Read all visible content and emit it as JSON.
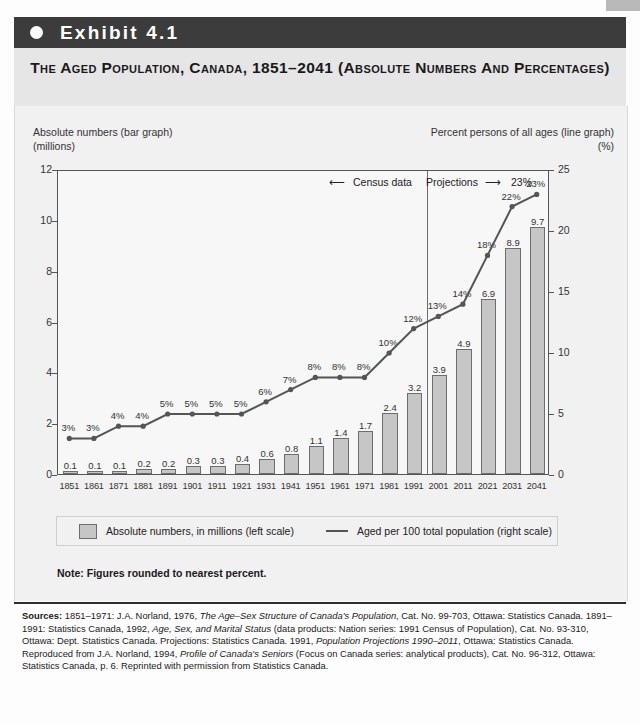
{
  "exhibit": {
    "bullet_icon": "filled-circle-icon",
    "label": "Exhibit 4.1"
  },
  "title": "The Aged Population, Canada, 1851–2041 (Absolute Numbers and Percentages)",
  "axis_captions": {
    "left_line1": "Absolute numbers (bar graph)",
    "left_line2": "(millions)",
    "right_line1": "Percent persons of all ages (line graph)",
    "right_line2": "(%)"
  },
  "annotations": {
    "census_data": "Census data",
    "projections": "Projections",
    "left_arrow_icon": "arrow-left-icon",
    "right_arrow_icon": "arrow-right-icon"
  },
  "legend": {
    "bars_label": "Absolute numbers, in millions (left scale)",
    "line_label": "Aged per 100 total population (right scale)",
    "bar_swatch_color": "#c6c6c6",
    "line_swatch_color": "#555555"
  },
  "note": "Note: Figures rounded to nearest percent.",
  "sources": {
    "label": "Sources:",
    "text_1": " 1851–1971: J.A. Norland, 1976, ",
    "italic_1": "The Age–Sex Structure of Canada's Population",
    "text_2": ", Cat. No. 99-703, Ottawa: Statistics Canada. 1891–1991: Statistics Canada, 1992, ",
    "italic_2": "Age, Sex, and Marital Status",
    "text_3": " (data products: Nation series: 1991 Census of Population), Cat. No. 93-310, Ottawa: Dept. Statistics Canada. Projections: Statistics Canada. 1991, ",
    "italic_3": "Population Projections 1990–2011",
    "text_4": ", Ottawa: Statistics Canada. Reproduced from J.A. Norland, 1994, ",
    "italic_4": "Profile of Canada's Seniors",
    "text_5": " (Focus on Canada series: analytical products), Cat. No. 96-312, Ottawa: Statistics Canada, p. 6. Reprinted with permission from Statistics Canada."
  },
  "chart_data": {
    "type": "bar",
    "title": "The Aged Population, Canada, 1851–2041 (Absolute Numbers and Percentages)",
    "xlabel": "",
    "ylabel": "Absolute numbers (bar graph) (millions)",
    "y2label": "Percent persons of all ages (line graph) (%)",
    "categories": [
      "1851",
      "1861",
      "1871",
      "1881",
      "1891",
      "1901",
      "1911",
      "1921",
      "1931",
      "1941",
      "1951",
      "1961",
      "1971",
      "1981",
      "1991",
      "2001",
      "2011",
      "2021",
      "2031",
      "2041"
    ],
    "ylim": [
      0,
      12
    ],
    "yticks": [
      0,
      2,
      4,
      6,
      8,
      10,
      12
    ],
    "y2lim": [
      0,
      25
    ],
    "y2ticks": [
      0,
      5,
      10,
      15,
      20,
      25
    ],
    "grid": false,
    "legend_position": "bottom",
    "series": [
      {
        "name": "Absolute numbers, in millions (left scale)",
        "type": "bar",
        "axis": "left",
        "color": "#c6c6c6",
        "values": [
          0.1,
          0.1,
          0.1,
          0.2,
          0.2,
          0.3,
          0.3,
          0.4,
          0.6,
          0.8,
          1.1,
          1.4,
          1.7,
          2.4,
          3.2,
          3.9,
          4.9,
          6.9,
          8.9,
          9.7
        ],
        "labels": [
          "0.1",
          "0.1",
          "0.1",
          "0.2",
          "0.2",
          "0.3",
          "0.3",
          "0.4",
          "0.6",
          "0.8",
          "1.1",
          "1.4",
          "1.7",
          "2.4",
          "3.2",
          "3.9",
          "4.9",
          "6.9",
          "8.9",
          "9.7"
        ]
      },
      {
        "name": "Aged per 100 total population (right scale)",
        "type": "line",
        "axis": "right",
        "color": "#555555",
        "values": [
          3,
          3,
          4,
          4,
          5,
          5,
          5,
          5,
          6,
          7,
          8,
          8,
          8,
          10,
          12,
          13,
          14,
          18,
          22,
          23
        ],
        "labels": [
          "3%",
          "3%",
          "4%",
          "4%",
          "5%",
          "5%",
          "5%",
          "5%",
          "6%",
          "7%",
          "8%",
          "8%",
          "8%",
          "10%",
          "12%",
          "13%",
          "14%",
          "18%",
          "22%",
          "23%"
        ]
      }
    ],
    "divider_at_category": "2001",
    "annotations": [
      "Census data",
      "Projections"
    ]
  }
}
